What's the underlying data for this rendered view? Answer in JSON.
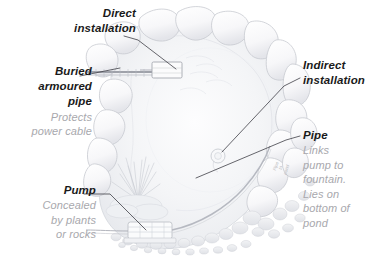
{
  "figure": {
    "style": "pencil-sketch",
    "background_color": "#ffffff",
    "heading_color": "#1a1a1a",
    "body_color": "#a8a8ad",
    "leader_color": "#4a4a52",
    "sketch_color": "#b5b5bc"
  },
  "callouts": [
    {
      "id": "direct-installation",
      "head": "Direct",
      "head2": "installation",
      "body": [],
      "align": "right"
    },
    {
      "id": "buried-armoured-pipe",
      "head": "Buried",
      "head2": "armoured",
      "head3": "pipe",
      "body": [
        "Protects",
        "power cable"
      ],
      "align": "right"
    },
    {
      "id": "pump",
      "head": "Pump",
      "body": [
        "Concealed",
        "by plants",
        "or rocks"
      ],
      "align": "right"
    },
    {
      "id": "indirect-installation",
      "head": "Indirect",
      "head2": "installation",
      "body": [],
      "align": "left"
    },
    {
      "id": "pipe",
      "head": "Pipe",
      "body": [
        "Links",
        "pump to",
        "fountain.",
        "Lies on",
        "bottom of",
        "pond"
      ],
      "align": "left"
    }
  ],
  "direct": {
    "line1": "Direct",
    "line2": "installation"
  },
  "buried": {
    "line1": "Buried",
    "line2": "armoured",
    "line3": "pipe",
    "body1": "Protects",
    "body2": "power cable"
  },
  "pump": {
    "line1": "Pump",
    "body1": "Concealed",
    "body2": "by plants",
    "body3": "or rocks"
  },
  "indirect": {
    "line1": "Indirect",
    "line2": "installation"
  },
  "pipe": {
    "line1": "Pipe",
    "body1": "Links",
    "body2": "pump to",
    "body3": "fountain.",
    "body4": "Lies on",
    "body5": "bottom of",
    "body6": "pond"
  },
  "inline_labels": {
    "pipe_on_art": "Pipe\nto\npond"
  }
}
